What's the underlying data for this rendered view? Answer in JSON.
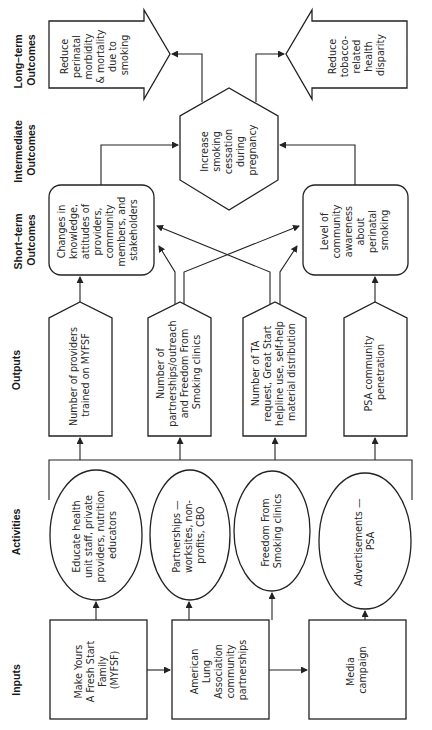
{
  "row_labels": {
    "long_term": [
      "Long–term",
      "Outcomes"
    ],
    "intermediate": [
      "Intermediate",
      "Outcomes"
    ],
    "short_term": [
      "Short–term",
      "Outcomes"
    ],
    "outputs": [
      "Outputs"
    ],
    "activities": [
      "Activities"
    ],
    "inputs": [
      "Inputs"
    ]
  },
  "long_term_outcomes": [
    {
      "lines": [
        "Reduce",
        "perinatal",
        "morbidity",
        "& mortality",
        "due to",
        "smoking"
      ]
    },
    {
      "lines": [
        "Reduce",
        "tobacco-",
        "related",
        "health",
        "disparity"
      ]
    }
  ],
  "intermediate_outcome": {
    "lines": [
      "Increase",
      "smoking",
      "cessation",
      "during",
      "pregnancy"
    ]
  },
  "short_term_outcomes": [
    {
      "lines": [
        "Changes in",
        "knowledge,",
        "attitudes of",
        "providers,",
        "community",
        "members, and",
        "stakeholders"
      ]
    },
    {
      "lines": [
        "Level of",
        "community",
        "awareness",
        "about",
        "perinatal",
        "smoking"
      ]
    }
  ],
  "outputs": [
    {
      "lines": [
        "Number of providers",
        "trained on MYFSF"
      ]
    },
    {
      "lines": [
        "Number of",
        "partnerships/outreach",
        "and Freedom From",
        "Smoking clinics"
      ]
    },
    {
      "lines": [
        "Number of TA",
        "request, Great Start",
        "helpline use, self-help",
        "material distribution"
      ]
    },
    {
      "lines": [
        "PSA community",
        "penetration"
      ]
    }
  ],
  "activities": [
    {
      "lines": [
        "Educate health",
        "unit staff, private",
        "providers, nutrition",
        "educators"
      ]
    },
    {
      "lines": [
        "Partnerships —",
        "worksites, non-",
        "profits, CBO"
      ]
    },
    {
      "lines": [
        "Freedom From",
        "Smoking clinics"
      ]
    },
    {
      "lines": [
        "Advertisements —",
        "PSA"
      ]
    }
  ],
  "inputs": [
    {
      "lines": [
        "Make Yours",
        "A Fresh Start",
        "Family",
        "(MYFSF)"
      ]
    },
    {
      "lines": [
        "American",
        "Lung",
        "Association",
        "community",
        "partnerships"
      ]
    },
    {
      "lines": [
        "Media",
        "campaign"
      ]
    }
  ],
  "colors": {
    "stroke": "#222222",
    "text": "#2a2a2a",
    "background": "#ffffff"
  }
}
